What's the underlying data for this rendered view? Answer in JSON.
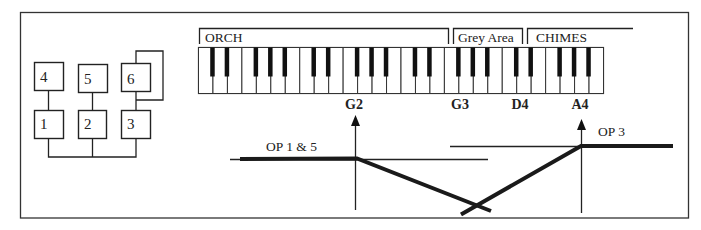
{
  "algorithm": {
    "operators": [
      {
        "id": "4",
        "label": "4",
        "row": "top",
        "col": 1
      },
      {
        "id": "5",
        "label": "5",
        "row": "top",
        "col": 2
      },
      {
        "id": "6",
        "label": "6",
        "row": "top",
        "col": 3,
        "feedback": true
      },
      {
        "id": "1",
        "label": "1",
        "row": "bottom",
        "col": 1
      },
      {
        "id": "2",
        "label": "2",
        "row": "bottom",
        "col": 2
      },
      {
        "id": "3",
        "label": "3",
        "row": "bottom",
        "col": 3
      }
    ]
  },
  "keyboard": {
    "octaves": 4,
    "white_keys": 28,
    "zones": [
      {
        "label": "ORCH"
      },
      {
        "label": "Grey Area"
      },
      {
        "label": "CHIMES"
      }
    ],
    "notes": [
      {
        "label": "G2"
      },
      {
        "label": "G3"
      },
      {
        "label": "D4"
      },
      {
        "label": "A4"
      }
    ]
  },
  "curves": {
    "op15": {
      "label": "OP 1 & 5",
      "breakpoint": "G2"
    },
    "op3": {
      "label": "OP 3",
      "breakpoint": "A4"
    }
  }
}
